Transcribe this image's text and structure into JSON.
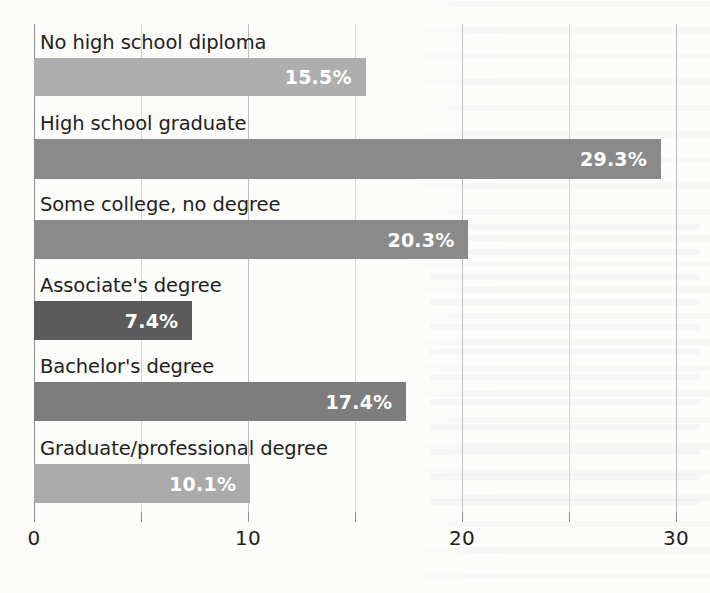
{
  "chart_data": {
    "type": "bar",
    "orientation": "horizontal",
    "title": "",
    "xlabel": "",
    "ylabel": "",
    "categories": [
      "No high school diploma",
      "High school graduate",
      "Some college, no degree",
      "Associate's degree",
      "Bachelor's degree",
      "Graduate/professional degree"
    ],
    "values": [
      15.5,
      29.3,
      20.3,
      7.4,
      17.4,
      10.1
    ],
    "value_labels": [
      "15.5%",
      "29.3%",
      "20.3%",
      "7.4%",
      "17.4%",
      "10.1%"
    ],
    "bar_colors": [
      "#aeaeae",
      "#8a8a8a",
      "#8a8a8a",
      "#5b5b5b",
      "#7d7d7d",
      "#aaaaaa"
    ],
    "xlim": [
      0,
      30
    ],
    "xticks": [
      0,
      10,
      20,
      30
    ],
    "xtick_labels": [
      "0",
      "10",
      "20",
      "30"
    ],
    "gridlines": [
      0,
      5,
      10,
      15,
      20,
      25,
      30
    ],
    "grid": true,
    "legend": "none",
    "value_label_color": "#ffffff",
    "axis_color": "#8e8e8e",
    "text_color": "#231f20",
    "background_color": "#fcfcfb"
  }
}
